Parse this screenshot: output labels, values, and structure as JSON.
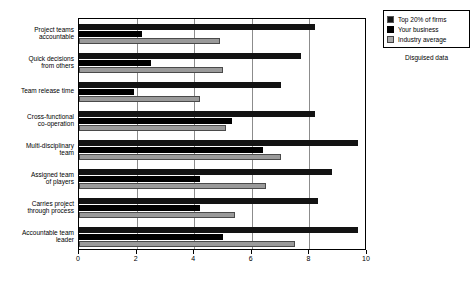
{
  "chart_data": {
    "type": "bar",
    "orientation": "horizontal",
    "title": "",
    "xlabel": "",
    "ylabel": "",
    "xlim": [
      0,
      10
    ],
    "xticks": [
      0,
      2,
      4,
      6,
      8,
      10
    ],
    "xtick_labels": [
      "0",
      "2",
      "4",
      "6",
      "8",
      "10"
    ],
    "grid": true,
    "legend_position": "top-right",
    "annotation": "Disguised data",
    "categories": [
      "Project teams\naccountable",
      "Quick decisions\nfrom others",
      "Team release time",
      "Cross-functional\nco-operation",
      "Multi-disciplinary\nteam",
      "Assigned team\nof players",
      "Carries project\nthrough process",
      "Accountable team\nleader"
    ],
    "series": [
      {
        "name": "Top 20% of firms",
        "color": "#131313",
        "values": [
          8.2,
          7.7,
          7.0,
          8.2,
          9.7,
          8.8,
          8.3,
          9.7
        ]
      },
      {
        "name": "Your business",
        "color": "#000000",
        "values": [
          2.2,
          2.5,
          1.9,
          5.3,
          6.4,
          4.2,
          4.2,
          5.0
        ]
      },
      {
        "name": "Industry average",
        "color": "#9a9a9a",
        "values": [
          4.9,
          5.0,
          4.2,
          5.1,
          7.0,
          6.5,
          5.4,
          7.5
        ]
      }
    ]
  },
  "legend": {
    "items": [
      {
        "label": "Top 20% of firms"
      },
      {
        "label": "Your business"
      },
      {
        "label": "Industry average"
      }
    ],
    "caption": "Disguised data"
  }
}
